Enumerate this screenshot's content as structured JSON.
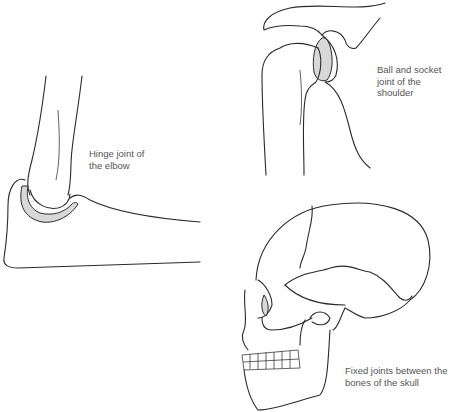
{
  "figures": [
    {
      "id": "elbow",
      "subject": "elbow-joint-illustration",
      "caption_lines": [
        "Hinge joint of",
        "the elbow"
      ],
      "caption_pos": {
        "x": 89,
        "y": 148
      }
    },
    {
      "id": "shoulder",
      "subject": "shoulder-joint-illustration",
      "caption_lines": [
        "Ball and socket",
        "joint of the",
        "shoulder"
      ],
      "caption_pos": {
        "x": 377,
        "y": 64
      }
    },
    {
      "id": "skull",
      "subject": "skull-illustration",
      "caption_lines": [
        "Fixed joints between the",
        "bones of the skull"
      ],
      "caption_pos": {
        "x": 345,
        "y": 365
      }
    }
  ],
  "colors": {
    "background": "#ffffff",
    "line": "#2a2a2a",
    "shading": "#d8d8d8",
    "caption": "#555555"
  }
}
